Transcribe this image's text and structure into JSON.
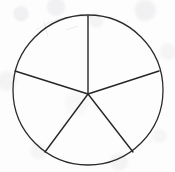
{
  "figure": {
    "title": "Circle divided into five sectors",
    "kind": "geometry-diagram",
    "background_color": "#fdfdfd",
    "canvas": {
      "width": 175,
      "height": 172
    }
  },
  "chart_data": {
    "type": "pie",
    "title": "Circle divided into five sectors",
    "xlabel": "",
    "ylabel": "",
    "categories": [
      "Sector 1",
      "Sector 2",
      "Sector 3",
      "Sector 4",
      "Sector 5"
    ],
    "values": [
      72,
      72,
      72,
      72,
      72
    ],
    "units": "degrees",
    "legend": "none",
    "grid": false,
    "labels_shown": false
  },
  "geometry": {
    "circle": {
      "name": "outer-circle",
      "center_x": 88,
      "center_y": 90,
      "radius": 75,
      "stroke_color": "#2b2b2b",
      "stroke_width": 1.3,
      "fill": "none"
    },
    "hub": {
      "name": "center-point",
      "x": 88,
      "y": 94
    },
    "spokes": [
      {
        "name": "radius-top",
        "angle_deg": 90,
        "end_x": 88,
        "end_y": 16
      },
      {
        "name": "radius-upper-left",
        "angle_deg": 162,
        "end_x": 15,
        "end_y": 71
      },
      {
        "name": "radius-upper-right",
        "angle_deg": 18,
        "end_x": 159,
        "end_y": 71
      },
      {
        "name": "radius-lower-left",
        "angle_deg": 234,
        "end_x": 45,
        "end_y": 152
      },
      {
        "name": "radius-lower-right",
        "angle_deg": 306,
        "end_x": 133,
        "end_y": 152
      }
    ],
    "spoke_stroke_color": "#262626",
    "spoke_stroke_width": 1.4
  }
}
